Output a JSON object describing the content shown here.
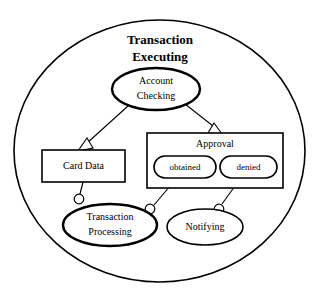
{
  "diagram": {
    "type": "uml-component-state-diagram",
    "background_color": "#ffffff",
    "line_color": "#000000",
    "title": {
      "line1": "Transaction",
      "line2": "Executing"
    },
    "container": {
      "name": "transaction-executing-boundary",
      "shape": "circle"
    },
    "nodes": [
      {
        "id": "account-checking",
        "label_line1": "Account",
        "label_line2": "Checking",
        "shape": "ellipse",
        "border": "thick"
      },
      {
        "id": "card-data",
        "label": "Card Data",
        "shape": "rectangle",
        "border": "medium"
      },
      {
        "id": "approval",
        "label": "Approval",
        "shape": "rectangle",
        "border": "medium"
      },
      {
        "id": "obtained",
        "label": "obtained",
        "shape": "stadium",
        "border": "medium"
      },
      {
        "id": "denied",
        "label": "denied",
        "shape": "stadium",
        "border": "medium"
      },
      {
        "id": "transaction-processing",
        "label_line1": "Transaction",
        "label_line2": "Processing",
        "shape": "ellipse",
        "border": "thick"
      },
      {
        "id": "notifying",
        "label": "Notifying",
        "shape": "ellipse",
        "border": "thin"
      }
    ],
    "edges": [
      {
        "id": "account-checking-to-card-data",
        "from": "account-checking",
        "to": "card-data",
        "connector": "hollow-triangle-arrow"
      },
      {
        "id": "account-checking-to-approval",
        "from": "account-checking",
        "to": "approval",
        "connector": "hollow-triangle-arrow"
      },
      {
        "id": "card-data-to-transaction-processing",
        "from": "card-data",
        "to": "transaction-processing",
        "connector": "ball-socket"
      },
      {
        "id": "obtained-to-transaction-processing",
        "from": "obtained",
        "to": "transaction-processing",
        "connector": "ball-socket"
      },
      {
        "id": "denied-to-notifying",
        "from": "denied",
        "to": "notifying",
        "connector": "ball-socket"
      }
    ]
  }
}
